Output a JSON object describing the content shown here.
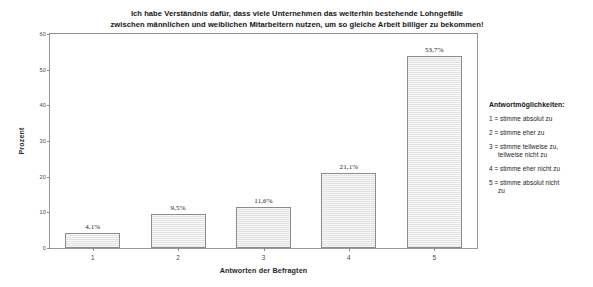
{
  "chart_data": {
    "type": "bar",
    "title": "Ich habe Verständnis dafür, dass viele Unternehmen das weiterhin bestehende Lohngefälle zwischen männlichen und weiblichen Mitarbeitern nutzen, um so gleiche Arbeit billiger zu bekommen!",
    "title_line1": "Ich habe Verständnis dafür, dass viele Unternehmen das weiterhin bestehende Lohngefälle",
    "title_line2": "zwischen männlichen und weiblichen Mitarbeitern nutzen, um so gleiche Arbeit billiger zu bekommen!",
    "xlabel": "Antworten der Befragten",
    "ylabel": "Prozent",
    "categories": [
      "1",
      "2",
      "3",
      "4",
      "5"
    ],
    "values": [
      4.1,
      9.5,
      11.6,
      21.1,
      53.7
    ],
    "data_labels": [
      "4,1%",
      "9,5%",
      "11,6%",
      "21,1%",
      "53,7%"
    ],
    "ylim": [
      0,
      60
    ],
    "yticks": [
      0,
      10,
      20,
      30,
      40,
      50,
      60
    ],
    "ytick_labels": [
      "0",
      "10",
      "20",
      "30",
      "40",
      "50",
      "60"
    ],
    "grid": false,
    "legend_position": "right-outside",
    "bar_color": "#e2e2e2",
    "bar_border_color": "#8c8c8c"
  },
  "legend": {
    "title": "Antwortmöglichkeiten:",
    "items": [
      {
        "key": "1",
        "text": "1 = stimme absolut zu",
        "continuation": ""
      },
      {
        "key": "2",
        "text": "2 = stimme eher zu",
        "continuation": ""
      },
      {
        "key": "3",
        "text": "3 = stimme teilweise zu,",
        "continuation": "teilweise nicht zu"
      },
      {
        "key": "4",
        "text": "4 = stimme eher nicht zu",
        "continuation": ""
      },
      {
        "key": "5",
        "text": "5 = stimme absolut nicht",
        "continuation": "zu"
      }
    ]
  }
}
